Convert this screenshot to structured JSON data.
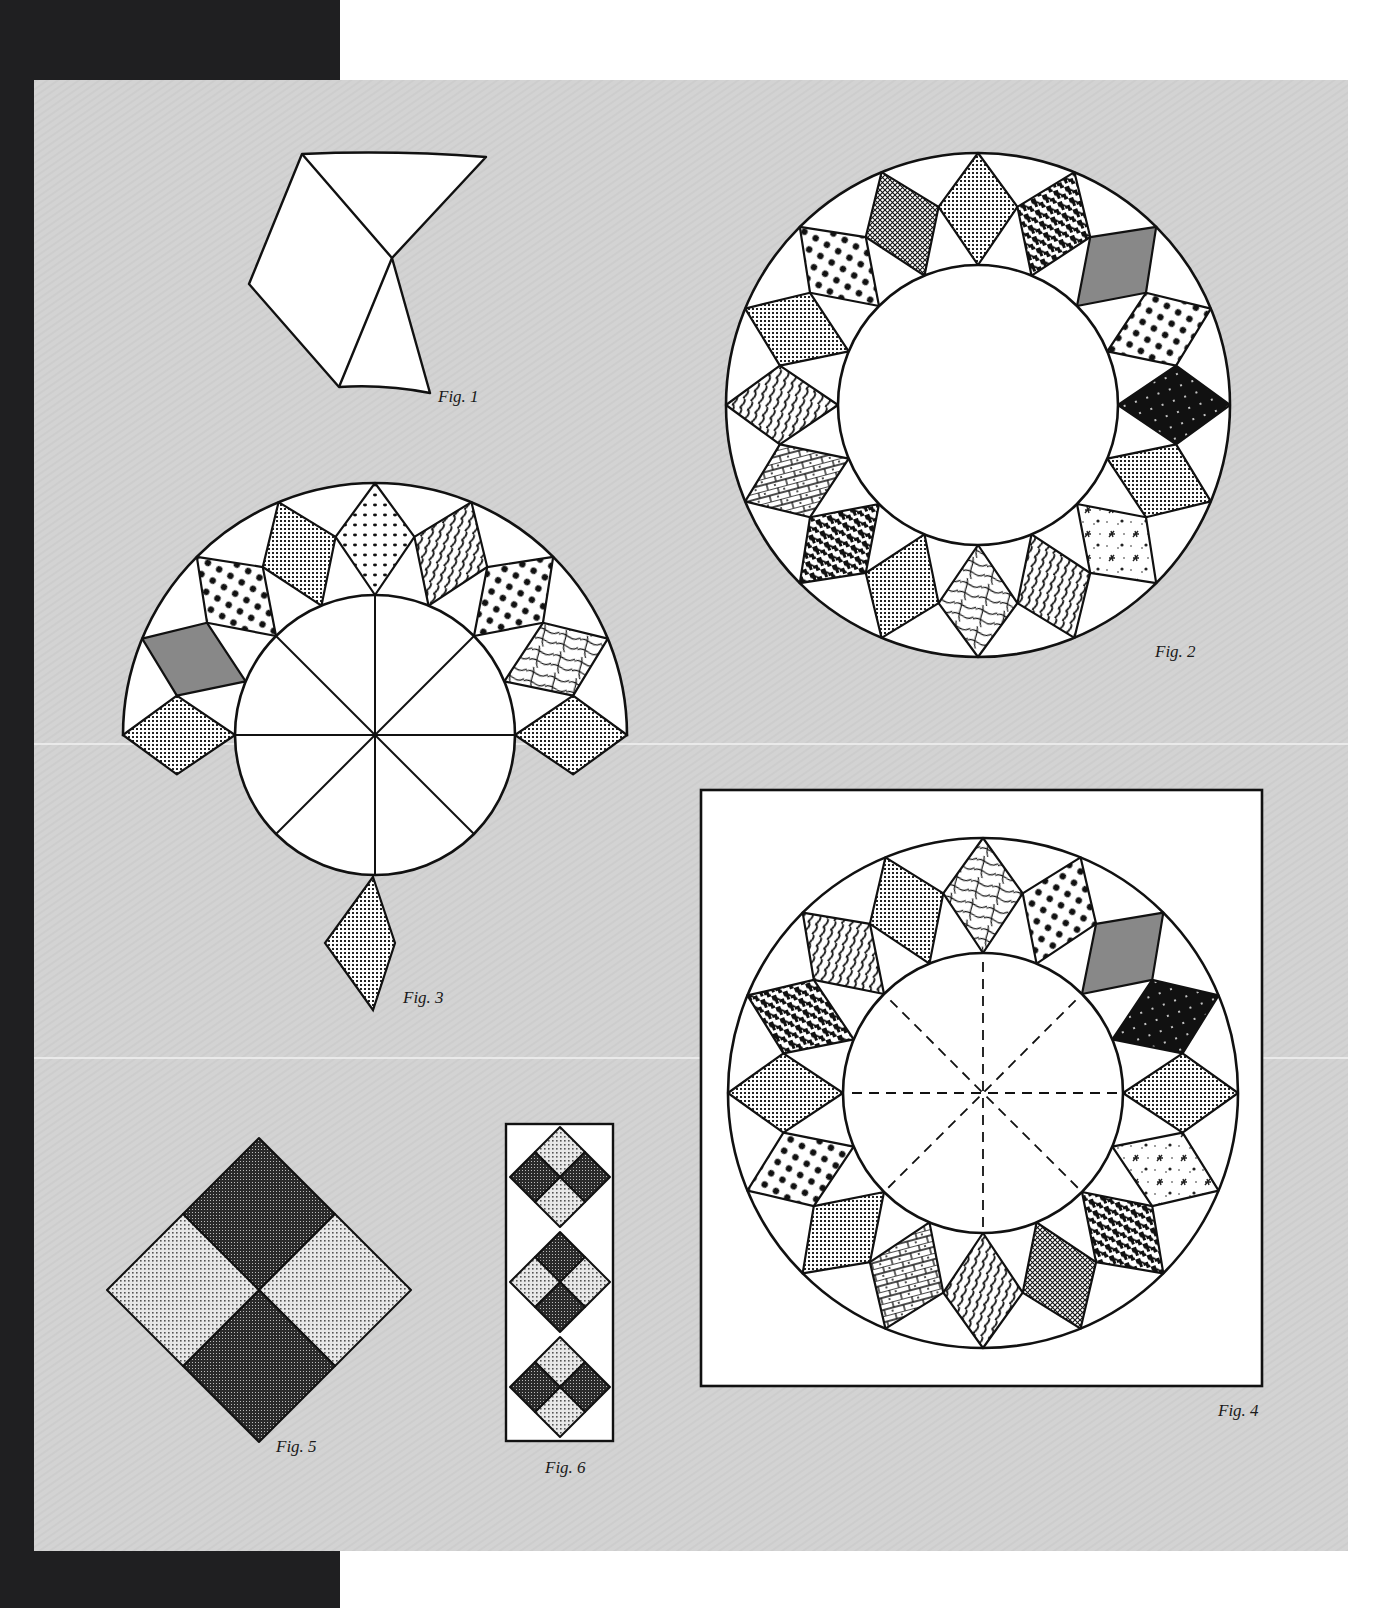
{
  "page": {
    "background": "#ffffff",
    "side_bar_color": "#1f1f21",
    "panel_color": "#d4d4d4",
    "line_color": "#111111"
  },
  "figures": [
    {
      "id": "fig1",
      "label": "Fig. 1",
      "description": "Single star-point unit: diamond with two background triangles (curved top and bottom edges)"
    },
    {
      "id": "fig2",
      "label": "Fig. 2",
      "description": "Complete ring of 16 patterned diamonds around a plain center circle"
    },
    {
      "id": "fig3",
      "label": "Fig. 3",
      "description": "Partial assembly: half ring of diamonds attached to a center circle divided into 8 wedges, with loose diamonds"
    },
    {
      "id": "fig4",
      "label": "Fig. 4",
      "description": "Finished block: ring of 16 diamonds on a square background with dashed guide lines in center circle"
    },
    {
      "id": "fig5",
      "label": "Fig. 5",
      "description": "Four-patch square set on point (dark top/bottom, light left/right)"
    },
    {
      "id": "fig6",
      "label": "Fig. 6",
      "description": "Border strip with three on-point four-patch squares, alternating shading"
    }
  ],
  "fig2_fabrics": [
    "grid",
    "houndstooth",
    "hatch",
    "dots",
    "crescent",
    "grid",
    "snow",
    "waves",
    "leaf",
    "grid",
    "houndstooth",
    "brick",
    "waves",
    "grid",
    "dots",
    "crosshatch"
  ],
  "fig3_fabrics": [
    "grid",
    "hatch",
    "dots",
    "grid",
    "ring-dots",
    "waves",
    "dots",
    "leaf",
    "grid"
  ],
  "fig4_fabrics": [
    "leaf",
    "dots",
    "hatch",
    "crescent",
    "grid",
    "snow",
    "houndstooth",
    "crosshatch",
    "waves",
    "brick",
    "grid",
    "dots",
    "grid",
    "houndstooth",
    "waves",
    "grid"
  ],
  "fig6_blocks": [
    {
      "top_bottom": "light",
      "left_right": "dark"
    },
    {
      "top_bottom": "dark",
      "left_right": "light"
    },
    {
      "top_bottom": "light",
      "left_right": "dark"
    }
  ]
}
